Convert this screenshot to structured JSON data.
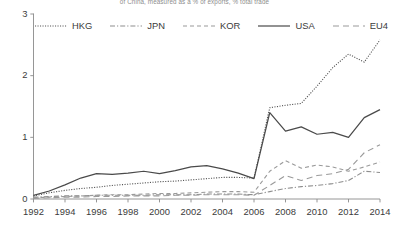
{
  "chart_data": {
    "type": "line",
    "title": "of China, measured as a % of exports, % total trade",
    "xlabel": "",
    "ylabel": "",
    "xlim": [
      1992,
      2014
    ],
    "ylim": [
      0,
      3
    ],
    "yticks": [
      0,
      1,
      2,
      3
    ],
    "ytick_labels": [
      "0",
      "1",
      "2",
      "3"
    ],
    "xticks": [
      1992,
      1994,
      1996,
      1998,
      2000,
      2002,
      2004,
      2006,
      2008,
      2010,
      2012,
      2014
    ],
    "xtick_labels": [
      "1992",
      "1994",
      "1996",
      "1998",
      "2000",
      "2002",
      "2004",
      "2006",
      "2008",
      "2010",
      "2012",
      "2014"
    ],
    "grid": false,
    "legend_position": "top",
    "x": [
      1992,
      1993,
      1994,
      1995,
      1996,
      1997,
      1998,
      1999,
      2000,
      2001,
      2002,
      2003,
      2004,
      2005,
      2006,
      2007,
      2008,
      2009,
      2010,
      2011,
      2012,
      2013,
      2014
    ],
    "series": [
      {
        "name": "HKG",
        "style": "dotted",
        "color": "#555555",
        "values": [
          0.05,
          0.1,
          0.14,
          0.17,
          0.19,
          0.22,
          0.24,
          0.26,
          0.28,
          0.29,
          0.31,
          0.33,
          0.35,
          0.35,
          0.34,
          1.48,
          1.52,
          1.55,
          1.83,
          2.13,
          2.35,
          2.22,
          2.58
        ]
      },
      {
        "name": "JPN",
        "style": "dashdot",
        "color": "#8d8d8d",
        "values": [
          0.03,
          0.04,
          0.05,
          0.05,
          0.06,
          0.06,
          0.06,
          0.06,
          0.07,
          0.07,
          0.07,
          0.08,
          0.08,
          0.08,
          0.07,
          0.12,
          0.17,
          0.2,
          0.22,
          0.25,
          0.3,
          0.45,
          0.43
        ]
      },
      {
        "name": "KOR",
        "style": "dashed",
        "color": "#9a9a9a",
        "values": [
          0.02,
          0.03,
          0.04,
          0.05,
          0.06,
          0.07,
          0.07,
          0.08,
          0.09,
          0.09,
          0.1,
          0.11,
          0.12,
          0.12,
          0.11,
          0.45,
          0.62,
          0.5,
          0.55,
          0.52,
          0.45,
          0.52,
          0.6
        ]
      },
      {
        "name": "USA",
        "style": "solid",
        "color": "#4a4a4a",
        "values": [
          0.06,
          0.13,
          0.23,
          0.34,
          0.41,
          0.4,
          0.42,
          0.45,
          0.41,
          0.46,
          0.52,
          0.54,
          0.49,
          0.42,
          0.33,
          1.4,
          1.1,
          1.17,
          1.05,
          1.08,
          1.0,
          1.32,
          1.45
        ]
      },
      {
        "name": "EU4",
        "style": "longdash",
        "color": "#9a9a9a",
        "values": [
          0.01,
          0.02,
          0.03,
          0.03,
          0.04,
          0.04,
          0.05,
          0.05,
          0.05,
          0.06,
          0.06,
          0.07,
          0.07,
          0.07,
          0.06,
          0.22,
          0.38,
          0.3,
          0.38,
          0.41,
          0.48,
          0.75,
          0.88
        ]
      }
    ]
  },
  "legend": {
    "items": [
      {
        "label": "HKG",
        "style": "dotted"
      },
      {
        "label": "JPN",
        "style": "dashdot"
      },
      {
        "label": "KOR",
        "style": "dashed"
      },
      {
        "label": "USA",
        "style": "solid"
      },
      {
        "label": "EU4",
        "style": "longdash"
      }
    ]
  },
  "axis": {
    "y_labels": [
      "3",
      "2",
      "1",
      "0"
    ],
    "x_labels": [
      "1992",
      "1994",
      "1996",
      "1998",
      "2000",
      "2002",
      "2004",
      "2006",
      "2008",
      "2010",
      "2012",
      "2014"
    ]
  }
}
